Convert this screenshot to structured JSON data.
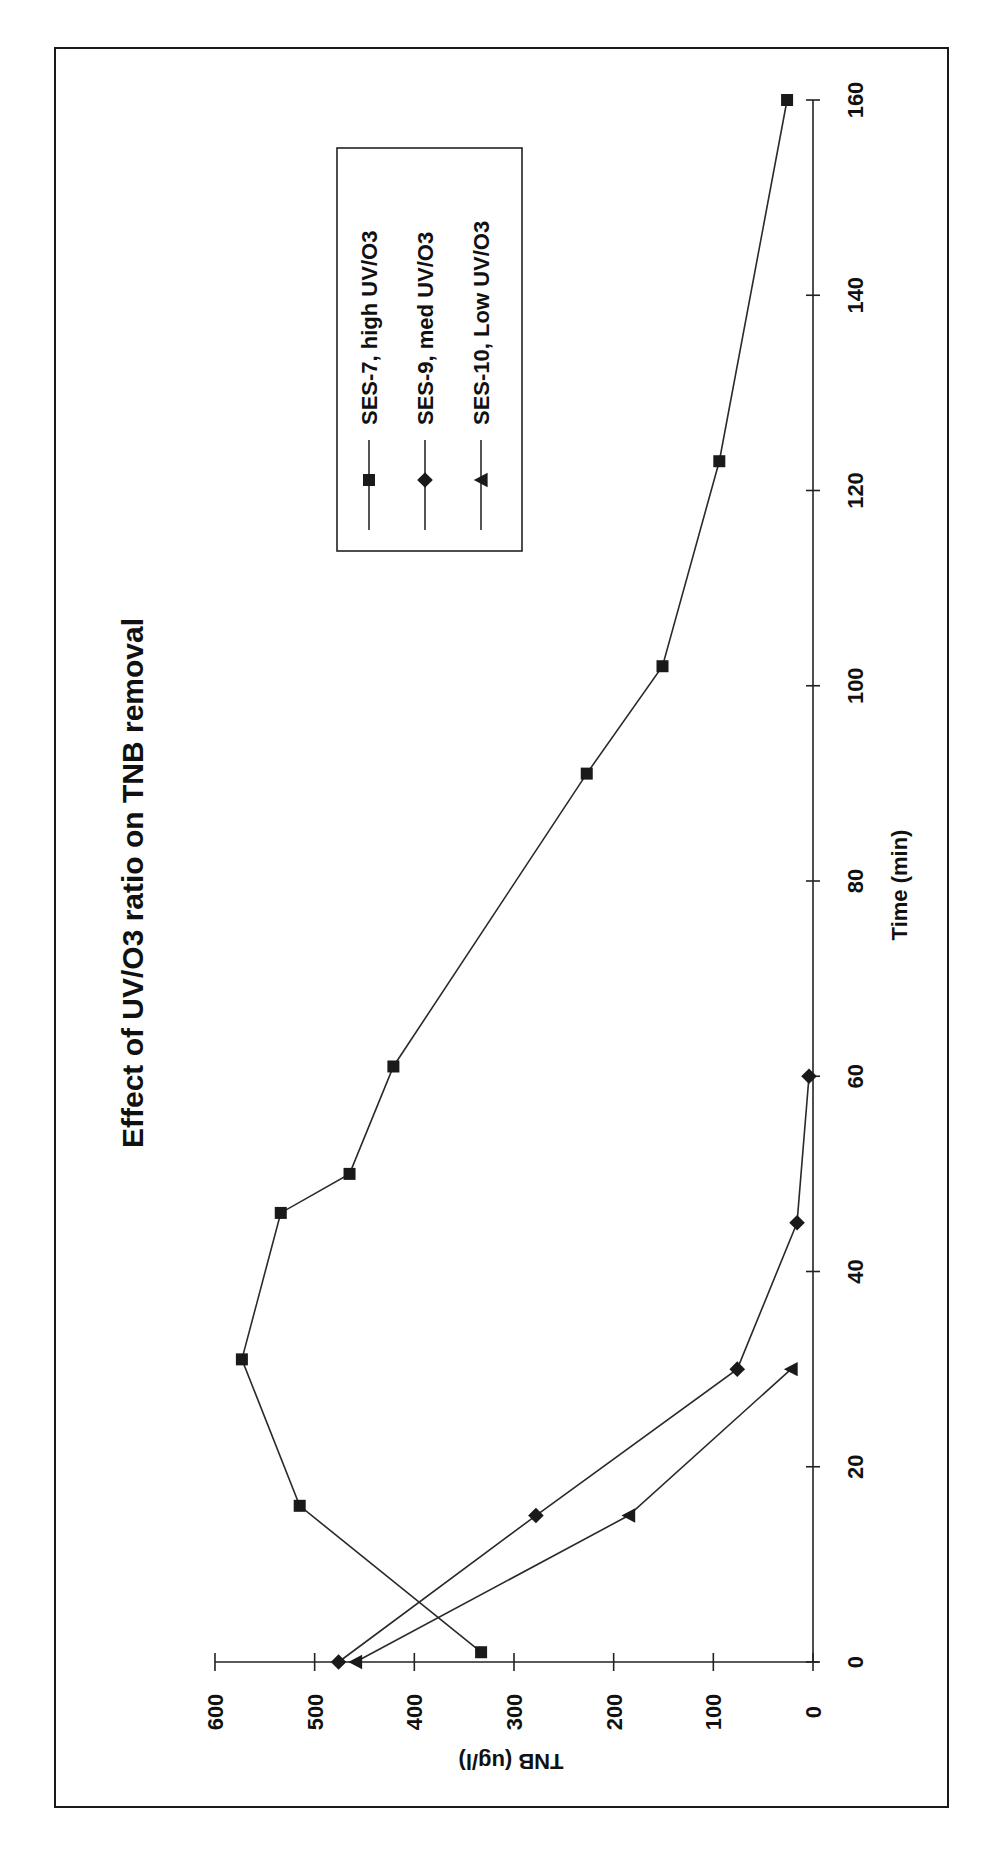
{
  "chart_data": {
    "type": "line",
    "title": "Effect of UV/O3 ratio on TNB removal",
    "xlabel": "Time (min)",
    "ylabel": "TNB (ug/l)",
    "xlim": [
      0,
      160
    ],
    "ylim": [
      0,
      600
    ],
    "x_ticks": [
      0,
      20,
      40,
      60,
      80,
      100,
      120,
      140,
      160
    ],
    "y_ticks": [
      0,
      100,
      200,
      300,
      400,
      500,
      600
    ],
    "grid": false,
    "orientation": "rotated 90 degrees counter-clockwise (time axis runs vertically on the right, TNB axis along the bottom)",
    "legend_position": "upper-left inside plot (rotated)",
    "series": [
      {
        "name": "SES-7, high UV/O3",
        "marker": "square",
        "x": [
          1,
          16,
          31,
          46,
          50,
          61,
          91,
          102,
          123,
          160
        ],
        "values": [
          333,
          515,
          573,
          534,
          465,
          421,
          227,
          151,
          94,
          26
        ]
      },
      {
        "name": "SES-9, med UV/O3",
        "marker": "diamond",
        "x": [
          0,
          15,
          30,
          45,
          60
        ],
        "values": [
          476,
          278,
          76,
          16,
          4
        ]
      },
      {
        "name": "SES-10, Low UV/O3",
        "marker": "triangle",
        "x": [
          0,
          15,
          30
        ],
        "values": [
          459,
          185,
          22
        ]
      }
    ]
  },
  "labels": {
    "title": "Effect of UV/O3 ratio on TNB removal",
    "x_axis_title": "Time (min)",
    "y_axis_title": "TNB (ug/l)",
    "x_tick_labels": [
      "0",
      "20",
      "40",
      "60",
      "80",
      "100",
      "120",
      "140",
      "160"
    ],
    "y_tick_labels": [
      "0",
      "100",
      "200",
      "300",
      "400",
      "500",
      "600"
    ],
    "legend": [
      "SES-7, high UV/O3",
      "SES-9, med UV/O3",
      "SES-10, Low UV/O3"
    ]
  }
}
